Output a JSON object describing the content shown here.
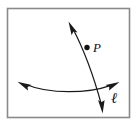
{
  "figure": {
    "background_color": "#ffffff",
    "stroke_color": "#1a1a1a",
    "frame": {
      "name": "figure-border",
      "color": "#8a8a8a",
      "x": 7,
      "y": 8,
      "width": 123,
      "height": 110
    },
    "labels": {
      "point_label": "P",
      "line_label": "ℓ"
    },
    "point": {
      "name": "point-p",
      "x": 87,
      "y": 47,
      "radius": 2.6,
      "fill": "#111111"
    },
    "curves": [
      {
        "name": "vertical-double-arrow-curve",
        "path": "M 70 25 C 80 42, 92 70, 102 108",
        "arrow_start": true,
        "arrow_end": true
      },
      {
        "name": "horizontal-double-arrow-curve",
        "path": "M 22 85 C 50 94, 90 92, 114 85",
        "arrow_start": true,
        "arrow_end": true
      }
    ]
  }
}
